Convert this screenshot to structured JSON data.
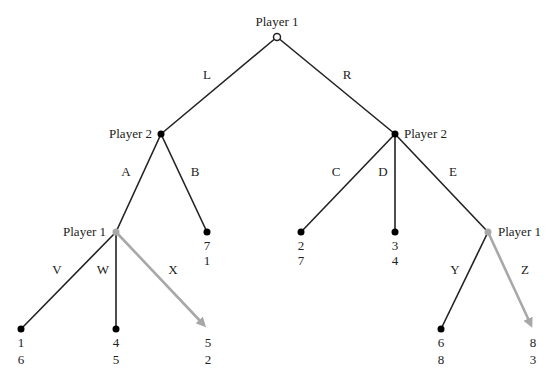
{
  "colors": {
    "edge": "#222222",
    "highlight": "#a8a8a8",
    "node": "#000000",
    "background": "#ffffff"
  },
  "nodes": {
    "root": {
      "player": "Player 1",
      "x": 277,
      "y": 37,
      "type": "hollow"
    },
    "p2_left": {
      "player": "Player 2",
      "x": 161,
      "y": 134,
      "type": "solid"
    },
    "p2_right": {
      "player": "Player 2",
      "x": 395,
      "y": 134,
      "type": "solid"
    },
    "p1_left": {
      "player": "Player 1",
      "x": 116,
      "y": 232,
      "type": "highlight"
    },
    "p1_right": {
      "player": "Player 1",
      "x": 488,
      "y": 232,
      "type": "highlight"
    }
  },
  "edges": {
    "L": "L",
    "R": "R",
    "A": "A",
    "B": "B",
    "C": "C",
    "D": "D",
    "E": "E",
    "V": "V",
    "W": "W",
    "X": "X",
    "Y": "Y",
    "Z": "Z"
  },
  "terminals": {
    "B": {
      "p1": "7",
      "p2": "1"
    },
    "C": {
      "p1": "2",
      "p2": "7"
    },
    "D": {
      "p1": "3",
      "p2": "4"
    },
    "V": {
      "p1": "1",
      "p2": "6"
    },
    "W": {
      "p1": "4",
      "p2": "5"
    },
    "X": {
      "p1": "5",
      "p2": "2"
    },
    "Y": {
      "p1": "6",
      "p2": "8"
    },
    "Z": {
      "p1": "8",
      "p2": "3"
    }
  },
  "highlighted_choices": [
    "X",
    "Z"
  ]
}
